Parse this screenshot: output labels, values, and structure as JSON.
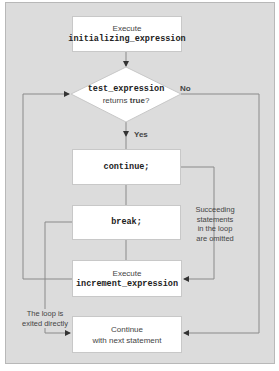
{
  "diagram": {
    "colors": {
      "panel": "#dcdcdc",
      "box": "#ffffff",
      "line": "#8a8a8a",
      "arrow": "#333333"
    },
    "nodes": {
      "init": {
        "line1": "Execute",
        "line2": "initializing_expression"
      },
      "test": {
        "line1": "test_expression",
        "line2_prefix": "returns ",
        "line2_bold": "true",
        "line2_suffix": "?"
      },
      "continue": {
        "label": "continue;"
      },
      "break": {
        "label": "break;"
      },
      "increment": {
        "line1": "Execute",
        "line2": "increment_expression"
      },
      "next": {
        "line1": "Continue",
        "line2": "with next statement"
      }
    },
    "edge_labels": {
      "no": "No",
      "yes": "Yes",
      "omitted": [
        "Succeeding",
        "statements",
        "in the loop",
        "are omitted"
      ],
      "exited": [
        "The loop is",
        "exited directly"
      ]
    }
  }
}
